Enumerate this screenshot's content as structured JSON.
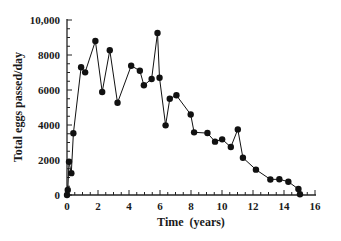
{
  "chart_data": {
    "type": "line",
    "title": "",
    "xlabel": "Time  (years)",
    "ylabel": "Total  eggs  passed/day",
    "xlim": [
      0,
      16
    ],
    "ylim": [
      0,
      10000
    ],
    "x_ticks": [
      0,
      2,
      4,
      6,
      8,
      10,
      12,
      14,
      16
    ],
    "x_tick_labels": [
      "0",
      "2",
      "4",
      "6",
      "8",
      "10",
      "12",
      "14",
      "16"
    ],
    "x_minor_step": 0.5,
    "y_ticks": [
      0,
      2000,
      4000,
      6000,
      8000,
      10000
    ],
    "y_tick_labels": [
      "0",
      "2000",
      "4000",
      "6000",
      "8000",
      "10,000"
    ],
    "y_minor_step": 500,
    "grid": false,
    "legend": null,
    "markers": "filled-circle",
    "series": [
      {
        "name": "Total eggs passed/day",
        "color": "#111111",
        "x": [
          0,
          0.05,
          0.13,
          0.28,
          0.41,
          0.91,
          1.17,
          1.83,
          2.27,
          2.76,
          3.26,
          4.14,
          4.7,
          4.96,
          5.46,
          5.84,
          5.97,
          6.36,
          6.63,
          7.06,
          7.98,
          8.2,
          9.06,
          9.55,
          10.01,
          10.57,
          11.02,
          11.35,
          12.19,
          13.12,
          13.7,
          14.28,
          14.93,
          15.03
        ],
        "y": [
          0,
          290,
          1900,
          1250,
          3530,
          7300,
          7010,
          8800,
          5890,
          8270,
          5270,
          7390,
          7100,
          6270,
          6630,
          9260,
          6700,
          3980,
          5500,
          5700,
          4600,
          3580,
          3540,
          3050,
          3180,
          2740,
          3750,
          2130,
          1450,
          890,
          900,
          760,
          340,
          40
        ]
      }
    ]
  }
}
